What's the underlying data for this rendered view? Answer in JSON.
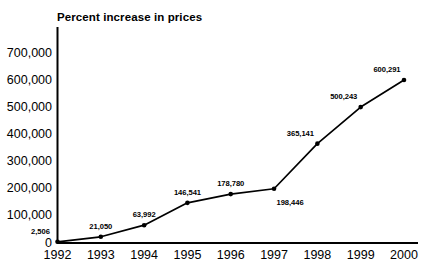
{
  "chart_data": {
    "type": "line",
    "title": "Percent increase in prices",
    "xlabel": "",
    "ylabel": "",
    "categories": [
      "1992",
      "1993",
      "1994",
      "1995",
      "1996",
      "1997",
      "1998",
      "1999",
      "2000"
    ],
    "values": [
      2506,
      21050,
      63992,
      146541,
      178780,
      198446,
      365141,
      500243,
      600291
    ],
    "point_labels": [
      "2,506",
      "21,050",
      "63,992",
      "146,541",
      "178,780",
      "198,446",
      "365,141",
      "500,243",
      "600,291"
    ],
    "ylim": [
      0,
      700000
    ],
    "yticks": [
      0,
      100000,
      200000,
      300000,
      400000,
      500000,
      600000,
      700000
    ],
    "ytick_labels": [
      "0",
      "100,000",
      "200,000",
      "300,000",
      "400,000",
      "500,000",
      "600,000",
      "700,000"
    ],
    "xtick_labels": [
      "1992",
      "1993",
      "1994",
      "1995",
      "1996",
      "1997",
      "1998",
      "1999",
      "2000"
    ],
    "grid": false,
    "legend": "none",
    "marker": "filled-circle",
    "line_color": "#000000",
    "marker_color": "#000000",
    "axis_color": "#000000",
    "background_color": "#ffffff",
    "label_positions": [
      "above-left",
      "above",
      "above",
      "above",
      "above",
      "below-right",
      "above-left",
      "above-left",
      "above-left"
    ]
  },
  "axes": {
    "y_axis_name": "value-axis",
    "x_axis_name": "year-axis"
  }
}
